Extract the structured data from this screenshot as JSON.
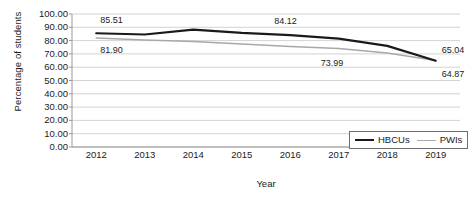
{
  "chart_data": {
    "type": "line",
    "title": "",
    "xlabel": "Year",
    "ylabel": "Percentage of students",
    "categories": [
      "2012",
      "2013",
      "2014",
      "2015",
      "2016",
      "2017",
      "2018",
      "2019"
    ],
    "x": [
      2012,
      2013,
      2014,
      2015,
      2016,
      2017,
      2018,
      2019
    ],
    "ylim": [
      0,
      100
    ],
    "yticks": [
      "0.00",
      "10.00",
      "20.00",
      "30.00",
      "40.00",
      "50.00",
      "60.00",
      "70.00",
      "80.00",
      "90.00",
      "100.00"
    ],
    "ytick_values": [
      0,
      10,
      20,
      30,
      40,
      50,
      60,
      70,
      80,
      90,
      100
    ],
    "grid": true,
    "legend_position": "bottom-right",
    "series": [
      {
        "name": "HBCUs",
        "color": "#1a1a1a",
        "values": [
          85.51,
          84.6,
          88.3,
          85.8,
          84.12,
          81.5,
          76.0,
          64.87
        ]
      },
      {
        "name": "PWIs",
        "color": "#a8a8a8",
        "values": [
          81.9,
          80.4,
          79.3,
          77.5,
          75.6,
          73.99,
          70.6,
          65.04
        ]
      }
    ],
    "annotations": [
      {
        "text": "85.51",
        "series": "HBCUs",
        "x": 2012,
        "value": 85.51
      },
      {
        "text": "81.90",
        "series": "PWIs",
        "x": 2012,
        "value": 81.9
      },
      {
        "text": "84.12",
        "series": "HBCUs",
        "x": 2016,
        "value": 84.12
      },
      {
        "text": "73.99",
        "series": "PWIs",
        "x": 2017,
        "value": 73.99
      },
      {
        "text": "65.04",
        "series": "PWIs",
        "x": 2019,
        "value": 65.04
      },
      {
        "text": "64.87",
        "series": "HBCUs",
        "x": 2019,
        "value": 64.87
      }
    ]
  },
  "legend": {
    "items": [
      {
        "label": "HBCUs"
      },
      {
        "label": "PWIs"
      }
    ]
  },
  "colors": {
    "hbcus_line": "#1a1a1a",
    "pwis_line": "#a8a8a8",
    "gridline": "#c8c8c8",
    "axis": "#9a9a9a",
    "text": "#1b1b1b",
    "background": "#ffffff"
  }
}
